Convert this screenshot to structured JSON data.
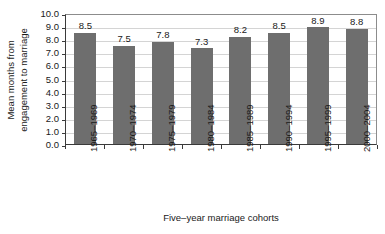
{
  "chart_data": {
    "type": "bar",
    "title": "",
    "xlabel": "Five–year marriage cohorts",
    "ylabel_line1": "Mean months from",
    "ylabel_line2": "engagement to marriage",
    "ylabel": "Mean months from engagement to marriage",
    "categories": [
      "1965–1969",
      "1970–1974",
      "1975–1979",
      "1980–1984",
      "1985–1989",
      "1990–1994",
      "1995–1999",
      "2000–2004"
    ],
    "values": [
      8.5,
      7.5,
      7.8,
      7.3,
      8.2,
      8.5,
      8.9,
      8.8
    ],
    "value_labels": [
      "8.5",
      "7.5",
      "7.8",
      "7.3",
      "8.2",
      "8.5",
      "8.9",
      "8.8"
    ],
    "ylim": [
      0.0,
      10.0
    ],
    "ytick_values": [
      10.0,
      9.0,
      8.0,
      7.0,
      6.0,
      5.0,
      4.0,
      3.0,
      2.0,
      1.0,
      0.0
    ],
    "ytick_labels": [
      "10.0",
      "9.0",
      "8.0",
      "7.0",
      "6.0",
      "5.0",
      "4.0",
      "3.0",
      "2.0",
      "1.0",
      "0.0"
    ],
    "grid": true,
    "legend": false,
    "legend_position": "none",
    "bar_color": "#6e6e6e",
    "gridline_color": "#d4d4d4",
    "axis_color": "#3a3a3a",
    "text_color": "#1a1a1a",
    "background_color": "#ffffff"
  }
}
